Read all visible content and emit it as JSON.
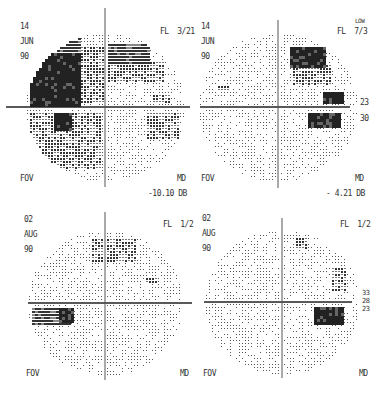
{
  "figure": {
    "panels": [
      {
        "id": "top-left",
        "date": [
          "14",
          "JUN",
          "90"
        ],
        "fixation_losses": "FL  3/21",
        "fovea": "FOV",
        "md_label": "MD",
        "md_value": "-10.10 DB",
        "origin": [
          105,
          107
        ],
        "radius": 78,
        "h_axis": [
          6,
          190
        ],
        "v_axis": [
          8,
          187
        ],
        "defects": [
          {
            "x": -75,
            "y": -55,
            "w": 50,
            "h": 52,
            "level": 4
          },
          {
            "x": -55,
            "y": -72,
            "w": 30,
            "h": 20,
            "level": 3
          },
          {
            "x": -30,
            "y": -62,
            "w": 28,
            "h": 58,
            "level": 2
          },
          {
            "x": 2,
            "y": -65,
            "w": 42,
            "h": 22,
            "level": 3
          },
          {
            "x": 2,
            "y": -45,
            "w": 55,
            "h": 18,
            "level": 2
          },
          {
            "x": -75,
            "y": 4,
            "w": 70,
            "h": 58,
            "level": 2
          },
          {
            "x": -52,
            "y": 4,
            "w": 18,
            "h": 18,
            "level": 4
          },
          {
            "x": 40,
            "y": 5,
            "w": 34,
            "h": 26,
            "level": 2
          },
          {
            "x": 48,
            "y": -14,
            "w": 16,
            "h": 8,
            "level": 2
          }
        ]
      },
      {
        "id": "top-right",
        "date": [
          "14",
          "JUN",
          "90"
        ],
        "fixation_losses": "FL  7/3",
        "fl_note": "LOW",
        "fovea": "FOV",
        "md_label": "MD",
        "md_value": "- 4.21 DB",
        "scale": [
          "23",
          "30"
        ],
        "origin": [
          278,
          107
        ],
        "radius": 78,
        "h_axis": [
          200,
          350
        ],
        "v_axis": [
          20,
          188
        ],
        "defects": [
          {
            "x": 10,
            "y": -60,
            "w": 35,
            "h": 20,
            "level": 4
          },
          {
            "x": 15,
            "y": -42,
            "w": 38,
            "h": 20,
            "level": 2
          },
          {
            "x": 45,
            "y": -16,
            "w": 18,
            "h": 12,
            "level": 4
          },
          {
            "x": 30,
            "y": 4,
            "w": 32,
            "h": 16,
            "level": 4
          },
          {
            "x": -62,
            "y": -22,
            "w": 12,
            "h": 6,
            "level": 2
          }
        ]
      },
      {
        "id": "bottom-left",
        "date": [
          "02",
          "AUG",
          "90"
        ],
        "fixation_losses": "FL  1/2",
        "fovea": "FOV",
        "md_label": "MD",
        "origin": [
          105,
          303
        ],
        "radius": 76,
        "h_axis": [
          28,
          192
        ],
        "v_axis": [
          212,
          380
        ],
        "defects": [
          {
            "x": -15,
            "y": -64,
            "w": 45,
            "h": 22,
            "level": 2
          },
          {
            "x": -75,
            "y": 4,
            "w": 40,
            "h": 16,
            "level": 3
          },
          {
            "x": -48,
            "y": 4,
            "w": 14,
            "h": 14,
            "level": 4
          },
          {
            "x": 40,
            "y": -26,
            "w": 10,
            "h": 6,
            "level": 2
          }
        ]
      },
      {
        "id": "bottom-right",
        "date": [
          "02",
          "AUG",
          "90"
        ],
        "fixation_losses": "FL  1/2",
        "fovea": "FOV",
        "md_label": "MD",
        "scale": [
          "33",
          "28",
          "23"
        ],
        "origin": [
          282,
          302
        ],
        "radius": 76,
        "h_axis": [
          204,
          352
        ],
        "v_axis": [
          218,
          378
        ],
        "defects": [
          {
            "x": 30,
            "y": 4,
            "w": 30,
            "h": 18,
            "level": 4
          },
          {
            "x": 48,
            "y": -34,
            "w": 14,
            "h": 22,
            "level": 2
          },
          {
            "x": 14,
            "y": -64,
            "w": 10,
            "h": 10,
            "level": 2
          }
        ]
      }
    ]
  }
}
